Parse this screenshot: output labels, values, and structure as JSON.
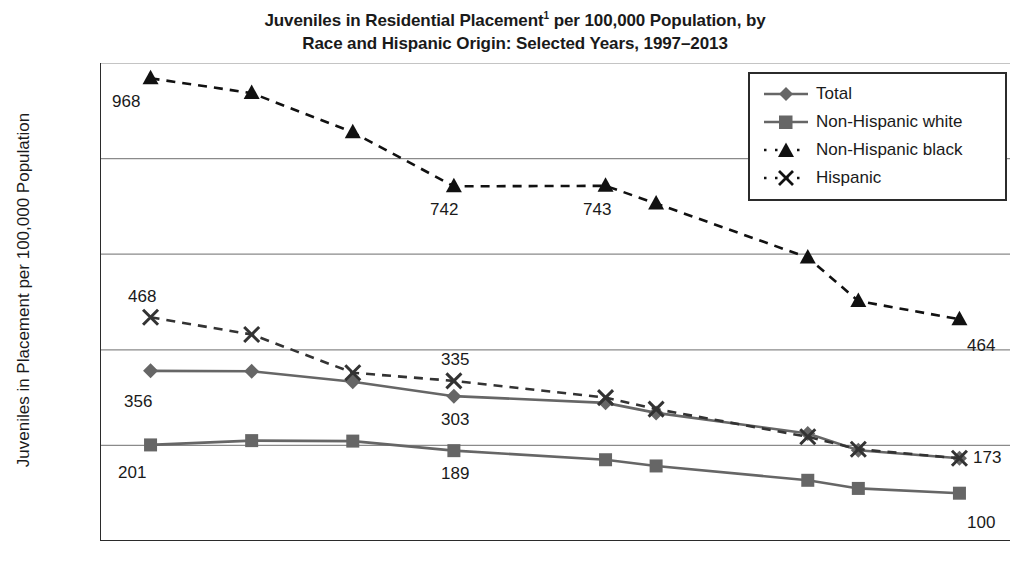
{
  "title": {
    "line1_pre": "Juveniles in Residential Placement",
    "line1_sup": "1",
    "line1_post": " per 100,000 Population, by",
    "line2": "Race and Hispanic Origin: Selected Years, 1997–2013"
  },
  "axes": {
    "ylabel": "Juveniles in Placement per 100,000 Population",
    "yticks": [
      "0",
      "200",
      "400",
      "600",
      "800",
      "1000"
    ],
    "xticks": [
      "1996",
      "1998",
      "2000",
      "2002",
      "2004",
      "2006",
      "2008",
      "2010",
      "2012",
      "2014"
    ]
  },
  "legend": {
    "items": [
      {
        "label": "Total",
        "marker": "diamond-marker",
        "style": "solid",
        "color": "#666666"
      },
      {
        "label": "Non-Hispanic white",
        "marker": "square-marker",
        "style": "solid",
        "color": "#666666"
      },
      {
        "label": "Non-Hispanic black",
        "marker": "triangle-marker",
        "style": "dashed",
        "color": "#111111"
      },
      {
        "label": "Hispanic",
        "marker": "x-marker",
        "style": "dashed",
        "color": "#333333"
      }
    ]
  },
  "point_labels": [
    {
      "text": "968",
      "x": 112,
      "y": 92
    },
    {
      "text": "742",
      "x": 430,
      "y": 200
    },
    {
      "text": "743",
      "x": 583,
      "y": 200
    },
    {
      "text": "464",
      "x": 967,
      "y": 336
    },
    {
      "text": "468",
      "x": 128,
      "y": 287
    },
    {
      "text": "335",
      "x": 441,
      "y": 350
    },
    {
      "text": "173",
      "x": 973,
      "y": 448
    },
    {
      "text": "356",
      "x": 124,
      "y": 392
    },
    {
      "text": "303",
      "x": 441,
      "y": 410
    },
    {
      "text": "201",
      "x": 118,
      "y": 463
    },
    {
      "text": "189",
      "x": 441,
      "y": 464
    },
    {
      "text": "100",
      "x": 967,
      "y": 513
    }
  ],
  "chart_data": {
    "type": "line",
    "xlabel": "",
    "ylabel": "Juveniles in Placement per 100,000 Population",
    "xlim": [
      1996,
      2014
    ],
    "ylim": [
      0,
      1000
    ],
    "ytick_step": 200,
    "grid": "horizontal",
    "legend_position": "top-right",
    "x": [
      1997,
      1999,
      2001,
      2003,
      2006,
      2007,
      2010,
      2011,
      2013
    ],
    "series": [
      {
        "name": "Total",
        "marker": "diamond",
        "style": "solid",
        "color": "#666666",
        "values": [
          356,
          355,
          333,
          303,
          289,
          268,
          225,
          190,
          173
        ]
      },
      {
        "name": "Non-Hispanic white",
        "marker": "square",
        "style": "solid",
        "color": "#666666",
        "values": [
          201,
          210,
          209,
          189,
          170,
          157,
          127,
          110,
          100
        ]
      },
      {
        "name": "Non-Hispanic black",
        "marker": "triangle",
        "style": "dashed",
        "color": "#111111",
        "values": [
          968,
          937,
          855,
          742,
          743,
          706,
          593,
          502,
          464
        ]
      },
      {
        "name": "Hispanic",
        "marker": "x",
        "style": "dashed",
        "color": "#333333",
        "values": [
          468,
          432,
          352,
          335,
          300,
          276,
          218,
          192,
          173
        ]
      }
    ],
    "annotations": [
      {
        "series": "Non-Hispanic black",
        "year": 1997,
        "value": 968
      },
      {
        "series": "Non-Hispanic black",
        "year": 2003,
        "value": 742
      },
      {
        "series": "Non-Hispanic black",
        "year": 2006,
        "value": 743
      },
      {
        "series": "Non-Hispanic black",
        "year": 2013,
        "value": 464
      },
      {
        "series": "Hispanic",
        "year": 1997,
        "value": 468
      },
      {
        "series": "Hispanic",
        "year": 2003,
        "value": 335
      },
      {
        "series": "Hispanic",
        "year": 2013,
        "value": 173
      },
      {
        "series": "Total",
        "year": 1997,
        "value": 356
      },
      {
        "series": "Total",
        "year": 2003,
        "value": 303
      },
      {
        "series": "Non-Hispanic white",
        "year": 1997,
        "value": 201
      },
      {
        "series": "Non-Hispanic white",
        "year": 2003,
        "value": 189
      },
      {
        "series": "Non-Hispanic white",
        "year": 2013,
        "value": 100
      }
    ]
  }
}
